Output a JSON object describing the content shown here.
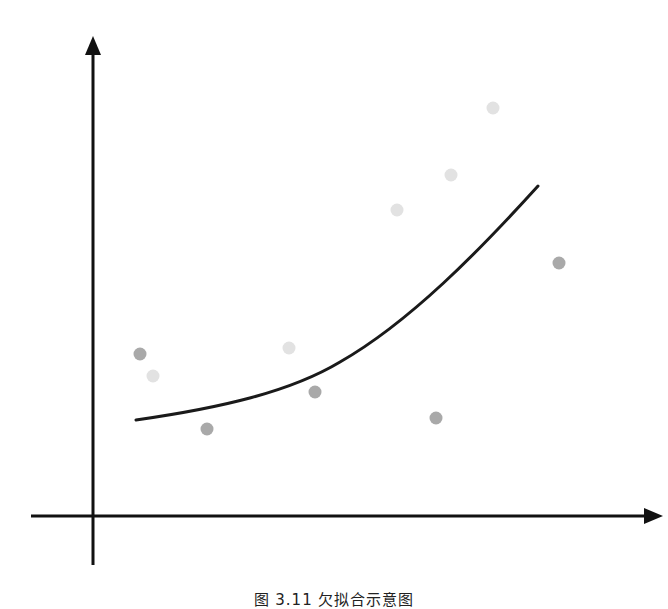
{
  "figure": {
    "caption": "图 3.11 欠拟合示意图",
    "colors": {
      "axis": "#111111",
      "curve": "#1a1a1a",
      "point_dark": "#a9a9a9",
      "point_light": "#e2e2e2"
    }
  },
  "chart_data": {
    "type": "scatter",
    "title": "",
    "xlabel": "",
    "ylabel": "",
    "grid": false,
    "legend": null,
    "axes": {
      "y_axis": {
        "x": 93,
        "y_top": 38,
        "y_bottom": 565
      },
      "x_axis": {
        "y": 516,
        "x_left": 31,
        "x_right": 658
      }
    },
    "series": [
      {
        "name": "dark points",
        "color": "#a9a9a9",
        "points": [
          [
            140,
            354
          ],
          [
            207,
            429
          ],
          [
            315,
            392
          ],
          [
            436,
            418
          ],
          [
            559,
            263
          ]
        ]
      },
      {
        "name": "light points",
        "color": "#e2e2e2",
        "points": [
          [
            153,
            376
          ],
          [
            289,
            348
          ],
          [
            397,
            210
          ],
          [
            451,
            175
          ],
          [
            493,
            108
          ]
        ]
      },
      {
        "name": "fitted curve",
        "type": "line",
        "color": "#1a1a1a",
        "path": [
          [
            136,
            420
          ],
          [
            230,
            405
          ],
          [
            320,
            372
          ],
          [
            420,
            300
          ],
          [
            538,
            186
          ]
        ]
      }
    ]
  }
}
